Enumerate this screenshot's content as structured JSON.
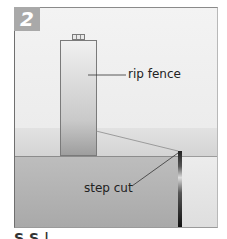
{
  "figure": {
    "step_number": "2",
    "labels": {
      "rip_fence": "rip fence",
      "step_cut": "step cut"
    },
    "caption_partial": "S  S           |"
  },
  "colors": {
    "badge": "#a9a9a9",
    "badge_text": "#ffffff",
    "blade": "#222222",
    "frame": "#6f6f6f"
  }
}
